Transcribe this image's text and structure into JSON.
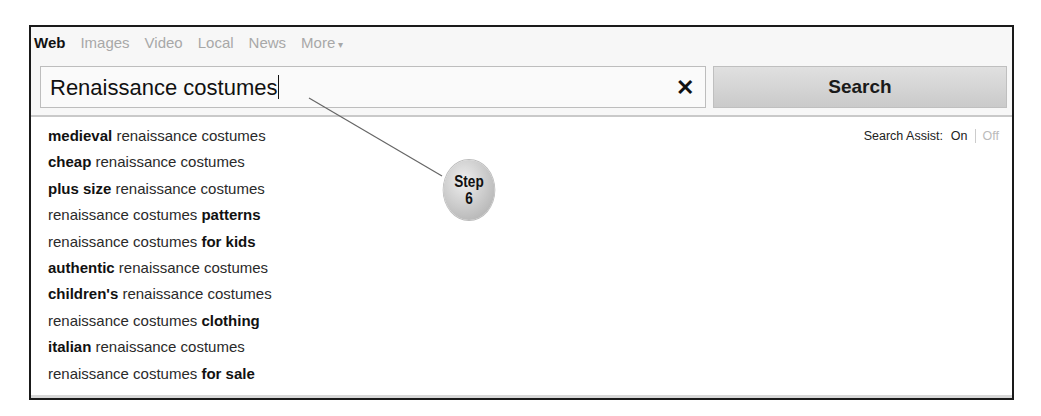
{
  "tabs": [
    {
      "label": "Web",
      "active": true
    },
    {
      "label": "Images",
      "active": false
    },
    {
      "label": "Video",
      "active": false
    },
    {
      "label": "Local",
      "active": false
    },
    {
      "label": "News",
      "active": false
    },
    {
      "label": "More",
      "active": false,
      "icon": "caret-down-icon",
      "icon_glyph": "▾"
    }
  ],
  "search": {
    "value": "Renaissance costumes",
    "clear_icon": "close-icon",
    "clear_glyph": "✕",
    "button_label": "Search"
  },
  "suggestions": [
    {
      "bold_before": "medieval",
      "text": "renaissance costumes",
      "bold_after": ""
    },
    {
      "bold_before": "cheap",
      "text": "renaissance costumes",
      "bold_after": ""
    },
    {
      "bold_before": "plus size",
      "text": "renaissance costumes",
      "bold_after": ""
    },
    {
      "bold_before": "",
      "text": "renaissance costumes",
      "bold_after": "patterns"
    },
    {
      "bold_before": "",
      "text": "renaissance costumes",
      "bold_after": "for kids"
    },
    {
      "bold_before": "authentic",
      "text": "renaissance costumes",
      "bold_after": ""
    },
    {
      "bold_before": "children's",
      "text": "renaissance costumes",
      "bold_after": ""
    },
    {
      "bold_before": "",
      "text": "renaissance costumes",
      "bold_after": "clothing"
    },
    {
      "bold_before": "italian",
      "text": "renaissance costumes",
      "bold_after": ""
    },
    {
      "bold_before": "",
      "text": "renaissance costumes",
      "bold_after": "for sale"
    }
  ],
  "search_assist": {
    "label": "Search Assist:",
    "on": "On",
    "off": "Off"
  },
  "callout": {
    "line1": "Step",
    "line2": "6"
  },
  "colors": {
    "frame_border": "#1a1a1a",
    "inactive_tab": "#a8a8a8",
    "button_bg": "#d4d4d4"
  }
}
